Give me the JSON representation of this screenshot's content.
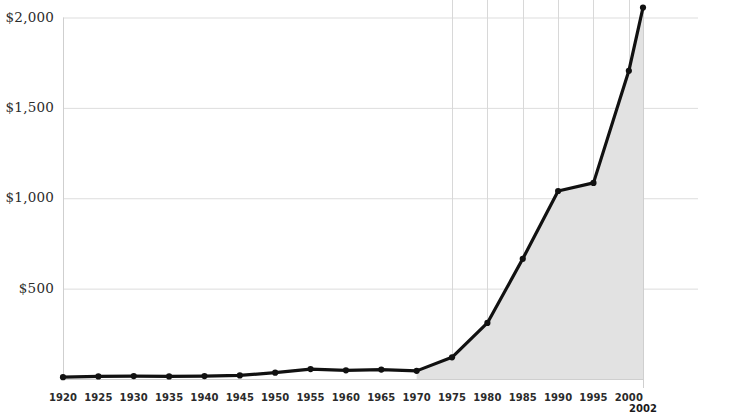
{
  "chart_data": {
    "type": "line",
    "title": "",
    "subtitle": "",
    "xlabel": "",
    "ylabel": "",
    "xlim": [
      1920,
      2002
    ],
    "ylim": [
      0,
      2100
    ],
    "grid": "both",
    "legend_position": "none",
    "fill_from_x": 1970,
    "fill_color": "#e2e2e2",
    "line_color": "#111111",
    "gridline_color": "#dddddd",
    "axis_color": "#cfcfcf",
    "x": [
      1920,
      1925,
      1930,
      1935,
      1940,
      1945,
      1950,
      1955,
      1960,
      1965,
      1970,
      1975,
      1980,
      1985,
      1990,
      1995,
      2000,
      2002
    ],
    "values": [
      10,
      14,
      16,
      14,
      16,
      20,
      35,
      55,
      48,
      52,
      45,
      120,
      310,
      665,
      1040,
      1085,
      1705,
      2055
    ],
    "y_ticks": [
      500,
      1000,
      1500,
      2000
    ],
    "y_tick_labels": [
      "$500",
      "$1,000",
      "$1,500",
      "$2,000"
    ],
    "x_ticks": [
      1920,
      1925,
      1930,
      1935,
      1940,
      1945,
      1950,
      1955,
      1960,
      1965,
      1970,
      1975,
      1980,
      1985,
      1990,
      1995,
      2000
    ],
    "x_tick_labels": [
      "1920",
      "1925",
      "1930",
      "1935",
      "1940",
      "1945",
      "1950",
      "1955",
      "1960",
      "1965",
      "1970",
      "1975",
      "1980",
      "1985",
      "1990",
      "1995",
      "2000"
    ],
    "x_gridlines": [
      1975,
      1980,
      1985,
      1990,
      1995,
      2000
    ],
    "end_label": "2002",
    "markers": true,
    "marker_shape": "circle"
  }
}
